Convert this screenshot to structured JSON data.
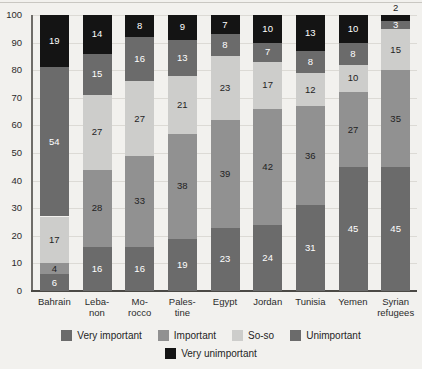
{
  "chart_data": {
    "type": "bar",
    "subtype": "stacked-bar-100-percent",
    "title": "",
    "subtitle": "",
    "xlabel": "",
    "ylabel": "",
    "ylim": [
      0,
      100
    ],
    "ytick_step": 10,
    "yticks": [
      100,
      90,
      80,
      70,
      60,
      50,
      40,
      30,
      20,
      10,
      0
    ],
    "grid": true,
    "legend_position": "bottom",
    "categories": [
      "Bahrain",
      "Lebanon",
      "Morocco",
      "Palestine",
      "Egypt",
      "Jordan",
      "Tunisia",
      "Yemen",
      "Syrian refugees"
    ],
    "category_label_lines": [
      [
        "Bahrain"
      ],
      [
        "Leba-",
        "non"
      ],
      [
        "Mo-",
        "rocco"
      ],
      [
        "Pales-",
        "tine"
      ],
      [
        "Egypt"
      ],
      [
        "Jordan"
      ],
      [
        "Tunisia"
      ],
      [
        "Yemen"
      ],
      [
        "Syrian",
        "refugees"
      ]
    ],
    "series": [
      {
        "name": "Very important",
        "color": "#6b6b6b",
        "label_color": "#ffffff",
        "values": [
          6,
          16,
          16,
          19,
          23,
          24,
          31,
          45,
          45
        ]
      },
      {
        "name": "Important",
        "color": "#919191",
        "label_color": "#1f1f1f",
        "values": [
          4,
          28,
          33,
          38,
          39,
          42,
          36,
          27,
          35
        ]
      },
      {
        "name": "So-so",
        "color": "#cdcdcb",
        "label_color": "#1f1f1f",
        "values": [
          17,
          27,
          27,
          21,
          23,
          17,
          12,
          10,
          15
        ]
      },
      {
        "name": "Unimportant",
        "color": "#6b6b6b",
        "label_color": "#ffffff",
        "values": [
          54,
          15,
          16,
          13,
          8,
          7,
          8,
          8,
          3
        ]
      },
      {
        "name": "Very unimportant",
        "color": "#141414",
        "label_color": "#ffffff",
        "values": [
          19,
          14,
          8,
          9,
          7,
          10,
          13,
          10,
          2
        ]
      }
    ],
    "label_outside": [
      [
        false,
        false,
        false,
        false,
        false
      ],
      [
        false,
        false,
        false,
        false,
        false
      ],
      [
        false,
        false,
        false,
        false,
        false
      ],
      [
        false,
        false,
        false,
        false,
        false
      ],
      [
        false,
        false,
        false,
        false,
        false
      ],
      [
        false,
        false,
        false,
        false,
        false
      ],
      [
        false,
        false,
        false,
        false,
        false
      ],
      [
        false,
        false,
        false,
        false,
        false
      ],
      [
        false,
        false,
        false,
        false,
        true
      ]
    ]
  },
  "legend": {
    "row1": [
      "Very important",
      "Important",
      "So-so",
      "Unimportant"
    ],
    "row2": [
      "Very unimportant"
    ]
  },
  "colors": {
    "very_important": "#6b6b6b",
    "important": "#919191",
    "so_so": "#cdcdcb",
    "unimportant": "#6b6b6b",
    "very_unimportant": "#141414",
    "background": "#f2f1ee",
    "axis": "#4b4945",
    "grid": "#dcdad5"
  }
}
